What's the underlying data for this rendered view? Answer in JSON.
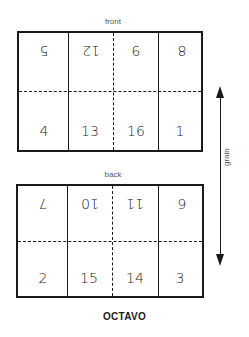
{
  "diagram": {
    "title": "OCTAVO",
    "grain_label": "grain",
    "front": {
      "label": "front",
      "top_row": [
        "5",
        "12",
        "9",
        "8"
      ],
      "bottom_row": [
        "4",
        "13",
        "16",
        "1"
      ]
    },
    "back": {
      "label": "back",
      "top_row": [
        "7",
        "10",
        "11",
        "6"
      ],
      "bottom_row": [
        "2",
        "15",
        "14",
        "3"
      ]
    }
  }
}
